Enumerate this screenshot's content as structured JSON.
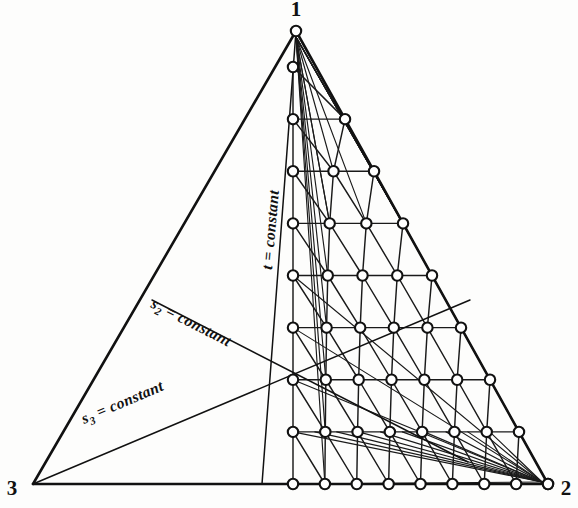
{
  "figure": {
    "type": "ternary-lattice-diagram",
    "background_color": "#fdfdfc",
    "line_color": "#111111",
    "node_fill_color": "#ffffff",
    "width": 578,
    "height": 508
  },
  "vertices": [
    {
      "id": "v1",
      "label": "1",
      "x": 296,
      "y": 31,
      "label_x": 296,
      "label_y": 16,
      "label_anchor": "middle"
    },
    {
      "id": "v2",
      "label": "2",
      "x": 548,
      "y": 484,
      "label_x": 566,
      "label_y": 495,
      "label_anchor": "middle"
    },
    {
      "id": "v3",
      "label": "3",
      "x": 33,
      "y": 484,
      "label_x": 12,
      "label_y": 495,
      "label_anchor": "middle"
    }
  ],
  "edges": [
    {
      "name": "edge-1-3",
      "from": "v1",
      "to": "v3"
    },
    {
      "name": "edge-1-2",
      "from": "v1",
      "to": "v2"
    },
    {
      "name": "edge-3-2",
      "from": "v3",
      "to": "v2"
    }
  ],
  "coordinate_lines": [
    {
      "id": "t-line",
      "label": "t = constant",
      "label_main": "t = constant",
      "symbol": "t",
      "subscript": "",
      "x1": 296,
      "y1": 31,
      "x2": 262,
      "y2": 484,
      "label_x": 272,
      "label_y": 270,
      "label_rotation": -85
    },
    {
      "id": "s2-line",
      "label": "s2 = constant",
      "label_main": " = constant",
      "symbol": "s",
      "subscript": "2",
      "x1": 152,
      "y1": 300,
      "x2": 468,
      "y2": 462,
      "label_x": 150,
      "label_y": 307,
      "label_rotation": 27
    },
    {
      "id": "s3-line",
      "label": "s3 = constant",
      "label_main": " = constant",
      "symbol": "s",
      "subscript": "3",
      "x1": 33,
      "y1": 484,
      "x2": 470,
      "y2": 300,
      "label_x": 84,
      "label_y": 424,
      "label_rotation": -23
    }
  ],
  "lattice": {
    "rows": 9,
    "left_column_x": 293,
    "row_spacing": 50.2,
    "top_y": 67,
    "bottom_y": 484,
    "apex_fan_count": 8,
    "right_fan_count": 9,
    "node_radius": 5.2,
    "description": "Triangular grid of circle nodes bounded left by the t = constant vertical column, right by edge 1-2, and below by edge 3-2"
  },
  "labels": {
    "vertex_1": "1",
    "vertex_2": "2",
    "vertex_3": "3",
    "t_constant": "t = constant",
    "s2_constant": "s2 = constant",
    "s3_constant": "s3 = constant"
  }
}
